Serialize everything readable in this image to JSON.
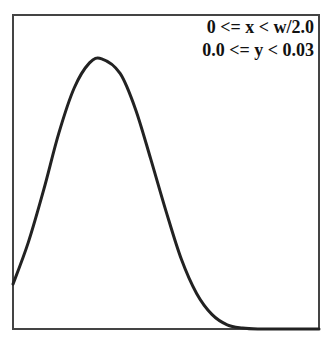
{
  "chart_data": {
    "type": "line",
    "title": "",
    "xlabel": "",
    "ylabel": "",
    "annotations": [
      "0 <= x < w/2.0",
      "0.0 <= y < 0.03"
    ],
    "xlim": [
      "0",
      "w/2.0"
    ],
    "ylim": [
      0.0,
      0.03
    ],
    "grid": false,
    "legend": null,
    "series": [
      {
        "name": "density",
        "x_frac": [
          0.0,
          0.05,
          0.1,
          0.15,
          0.2,
          0.25,
          0.29,
          0.35,
          0.4,
          0.45,
          0.5,
          0.55,
          0.6,
          0.65,
          0.7,
          0.75,
          0.8,
          0.9,
          1.0
        ],
        "y": [
          0.0043,
          0.0083,
          0.0133,
          0.0188,
          0.0231,
          0.0255,
          0.0259,
          0.0245,
          0.0211,
          0.0163,
          0.0113,
          0.0067,
          0.0034,
          0.0014,
          0.0004,
          0.0001,
          0.0,
          0.0,
          0.0
        ]
      }
    ]
  },
  "labels": {
    "x_range": "0 <= x < w/2.0",
    "y_range": "0.0 <= y < 0.03"
  },
  "colors": {
    "line": "#222222",
    "frame": "#444444",
    "background": "#ffffff"
  }
}
